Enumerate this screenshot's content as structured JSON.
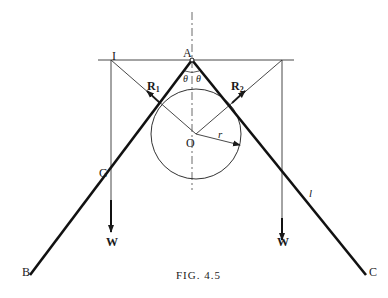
{
  "figure": {
    "caption": "Fig. 4.5",
    "caption_display": "FIG. 4.5",
    "points": {
      "A": "A",
      "I": "I",
      "O": "O",
      "G": "G",
      "B": "B",
      "C": "C"
    },
    "forces": {
      "R1": {
        "symbol": "R",
        "subscript": "1"
      },
      "R2": {
        "symbol": "R",
        "subscript": "2"
      },
      "W_left": "W",
      "W_right": "W"
    },
    "angles": {
      "theta_left": "θ",
      "theta_right": "θ"
    },
    "lengths": {
      "radius": "r",
      "rod_length": "l"
    },
    "colors": {
      "ink": "#1a1a1a",
      "background": "#ffffff"
    }
  }
}
